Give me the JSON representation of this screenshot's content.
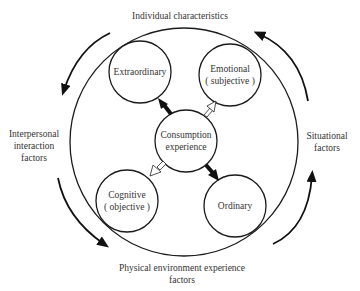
{
  "diagram": {
    "type": "concept-cycle",
    "center": {
      "line1": "Consumption",
      "line2": "experience"
    },
    "nodes": {
      "top_left": {
        "line1": "Extraordinary"
      },
      "top_right": {
        "line1": "Emotional",
        "line2": "( subjective )"
      },
      "bottom_left": {
        "line1": "Cognitive",
        "line2": "( objective )"
      },
      "bottom_right": {
        "line1": "Ordinary"
      }
    },
    "outer_factors": {
      "top": "Individual characteristics",
      "left": {
        "line1": "Interpersonal",
        "line2": "interaction",
        "line3": "factors"
      },
      "right": {
        "line1": "Situational",
        "line2": "factors"
      },
      "bottom": {
        "line1": "Physical environment experience",
        "line2": "factors"
      }
    },
    "arrows": {
      "center_to_extraordinary": "solid",
      "center_to_emotional": "hollow",
      "center_to_cognitive": "hollow",
      "center_to_ordinary": "solid",
      "outer_cycle_direction": "counterclockwise"
    },
    "colors": {
      "stroke": "#1a1a1a",
      "text": "#333333",
      "background": "#ffffff"
    }
  }
}
